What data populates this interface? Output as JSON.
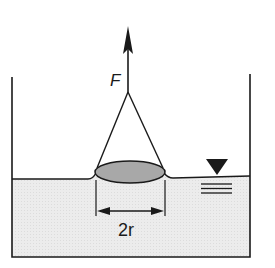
{
  "diagram": {
    "type": "physics-surface-tension",
    "labels": {
      "force": "F",
      "diameter": "2r"
    },
    "colors": {
      "stroke": "#1a1a1a",
      "water": "#ececec",
      "disk": "#a8a8a8",
      "background": "#ffffff"
    },
    "symbols": {
      "water_level_marker": "inverted-triangle-with-ripple-lines"
    }
  }
}
